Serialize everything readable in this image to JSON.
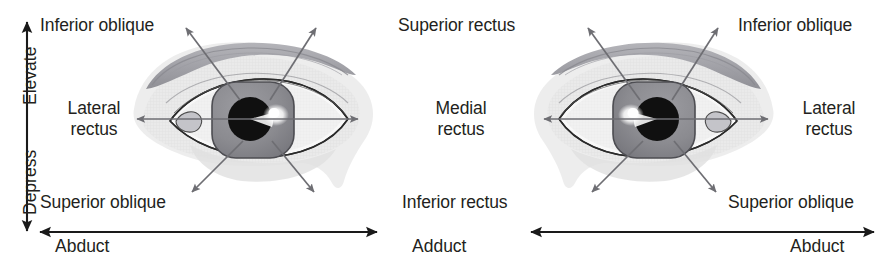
{
  "figure": {
    "background_color": "#ffffff",
    "text_color": "#231f20",
    "arrow_color": "#6e6e73",
    "axis_color": "#231f20"
  },
  "vertical_axis": {
    "top_label": "Elevate",
    "bottom_label": "Depress",
    "arrowheads": "both"
  },
  "left_eye": {
    "name": "left-eye-panel",
    "labels": {
      "upper_outer": "Inferior oblique",
      "middle_outer": "Lateral\nrectus",
      "middle_outer_line1": "Lateral",
      "middle_outer_line2": "rectus",
      "lower_outer": "Superior oblique",
      "upper_inner": "Superior rectus",
      "middle_inner_line1": "Medial",
      "middle_inner_line2": "rectus",
      "lower_inner": "Inferior rectus"
    },
    "horizontal_axis": {
      "left_label": "Abduct",
      "right_label": "Adduct",
      "arrowheads": "both"
    }
  },
  "right_eye": {
    "name": "right-eye-panel",
    "labels": {
      "upper_outer": "Inferior oblique",
      "middle_outer_line1": "Lateral",
      "middle_outer_line2": "rectus",
      "lower_outer": "Superior oblique"
    },
    "horizontal_axis": {
      "left_label": "Adduct",
      "right_label": "Abduct",
      "arrowheads": "both"
    }
  },
  "colors": {
    "iris": "#8d8d92",
    "iris_dark": "#7a7a80",
    "pupil": "#111111",
    "highlight": "#fdfdfd",
    "brow": "#a9a9ae",
    "brow_dark": "#94949a",
    "skin_tint": "#e3e3e3",
    "skin_tint_light": "#eeeeee",
    "sclera": "#f7f7f7",
    "outline": "#3a3a3a"
  }
}
